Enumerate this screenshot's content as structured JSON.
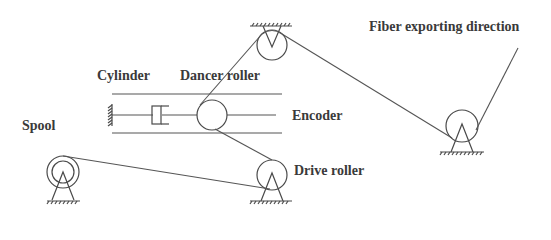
{
  "diagram": {
    "type": "mechanical schematic",
    "labels": {
      "fiber_direction": "Fiber exporting direction",
      "cylinder": "Cylinder",
      "dancer_roller": "Dancer roller",
      "encoder": "Encoder",
      "spool": "Spool",
      "drive_roller": "Drive roller"
    },
    "components": [
      {
        "id": "spool",
        "label": "Spool",
        "shape": "double-circle on triangular support"
      },
      {
        "id": "drive-roller",
        "label": "Drive roller",
        "shape": "circle on triangular support"
      },
      {
        "id": "dancer-roller",
        "label": "Dancer roller",
        "shape": "circle on slide rails"
      },
      {
        "id": "cylinder",
        "label": "Cylinder",
        "shape": "piston attached to wall"
      },
      {
        "id": "encoder",
        "label": "Encoder",
        "shape": "rail assembly"
      },
      {
        "id": "top-guide-roller",
        "label": "",
        "shape": "circle hung from ceiling"
      },
      {
        "id": "exit-guide-roller",
        "label": "",
        "shape": "circle on triangular support"
      }
    ],
    "fiber_path": [
      "spool",
      "drive-roller",
      "dancer-roller",
      "top-guide-roller",
      "exit-guide-roller",
      "fiber exporting direction"
    ],
    "colors": {
      "line": "#4a4a4a",
      "text": "#3a3a3a",
      "background": "#ffffff"
    }
  }
}
